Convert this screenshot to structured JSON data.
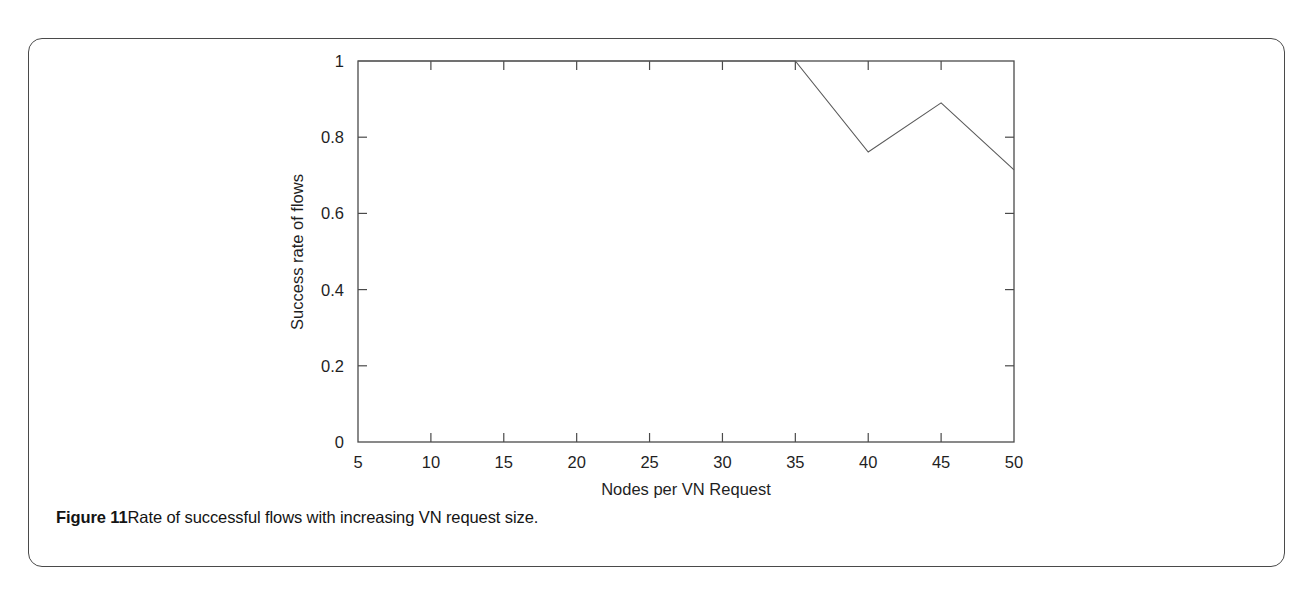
{
  "figure": {
    "caption_label": "Figure 11",
    "caption_text": "Rate of successful flows with increasing VN request size.",
    "border_color": "#4a4a4a",
    "background": "#ffffff"
  },
  "chart_data": {
    "type": "line",
    "title": "",
    "xlabel": "Nodes per VN Request",
    "ylabel": "Success rate of flows",
    "xlim": [
      5,
      50
    ],
    "ylim": [
      0,
      1
    ],
    "xticks": [
      5,
      10,
      15,
      20,
      25,
      30,
      35,
      40,
      45,
      50
    ],
    "xticklabels": [
      "5",
      "10",
      "15",
      "20",
      "25",
      "30",
      "35",
      "40",
      "45",
      "50"
    ],
    "yticks": [
      0,
      0.2,
      0.4,
      0.6,
      0.8,
      1
    ],
    "yticklabels": [
      "0",
      "0.2",
      "0.4",
      "0.6",
      "0.8",
      "1"
    ],
    "grid": false,
    "legend": false,
    "legend_position": "none",
    "line_color": "#5a5a5a",
    "line_width": 1.1,
    "series": [
      {
        "name": "Success rate of flows",
        "x": [
          5,
          10,
          15,
          20,
          25,
          30,
          35,
          40,
          45,
          50
        ],
        "values": [
          1,
          1,
          1,
          1,
          1,
          1,
          1,
          0.761,
          0.89,
          0.714
        ]
      }
    ]
  }
}
